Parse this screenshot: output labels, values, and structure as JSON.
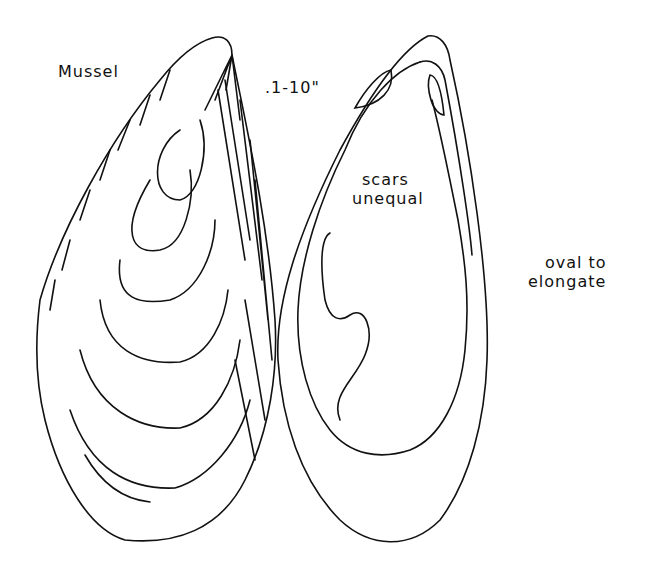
{
  "figure": {
    "title": "Mussel",
    "size_label": ".1-10\"",
    "interior_label": [
      "scars",
      "unequal"
    ],
    "shape_label": [
      "oval to",
      "elongate"
    ],
    "colors": {
      "ink": "#111111",
      "background": "#ffffff"
    },
    "views": [
      {
        "name": "exterior-valve",
        "description": "exterior view with concentric growth lines"
      },
      {
        "name": "interior-valve",
        "description": "interior view showing unequal muscle scars and pallial line"
      }
    ]
  }
}
